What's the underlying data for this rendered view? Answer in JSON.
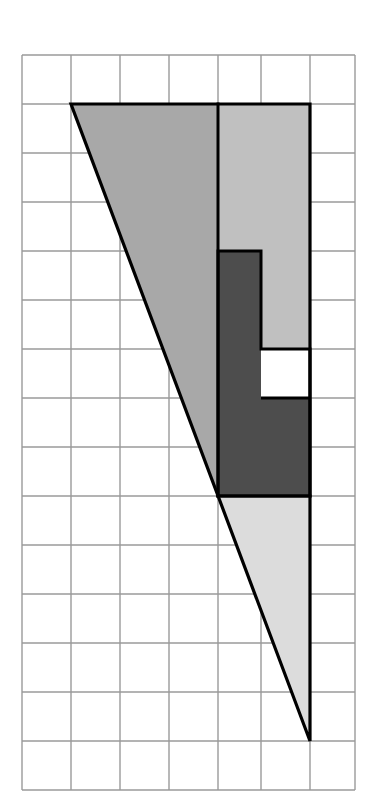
{
  "figure": {
    "canvas": {
      "width": 373,
      "height": 809,
      "background": "#ffffff"
    },
    "grid": {
      "origin_x": 22,
      "origin_y": 55,
      "cell_size": 49,
      "cols": 7,
      "rows": 15,
      "line_color": "#9a9a9a",
      "line_width": 1.4,
      "x_lines": [
        22,
        71,
        120,
        169,
        218,
        261,
        310,
        355
      ],
      "y_lines": [
        55,
        104,
        153,
        202,
        251,
        300,
        349,
        398,
        447,
        496,
        545,
        594,
        643,
        692,
        741,
        790
      ]
    },
    "palette": {
      "outline": "#000000",
      "medium_gray": "#a8a8a8",
      "light_gray": "#c0c0c0",
      "dark_gray": "#4d4d4d",
      "pale_gray": "#dcdcdc",
      "white": "#ffffff"
    },
    "outline_width": 3.2,
    "inner_outline_width": 3.0,
    "vertices": {
      "apex_top_left": [
        71,
        104
      ],
      "apex_bottom": [
        310,
        741
      ],
      "top_right": [
        310,
        104
      ]
    },
    "regions": [
      {
        "name": "medium-gray-left-region",
        "fill": "#a8a8a8",
        "points": "71,104 218,104 218,496 224,496"
      },
      {
        "name": "light-gray-upper-right-region",
        "fill": "#c0c0c0",
        "points": "218,104 310,104 310,251 261,251 261,398 310,398 310,496 218,496"
      },
      {
        "name": "dark-gray-l-region",
        "fill": "#4d4d4d",
        "points": "218,251 261,251 261,349 310,349 310,398 261,398 261,398 310,398 310,496 218,496"
      },
      {
        "name": "pale-gray-lower-region",
        "fill": "#dcdcdc",
        "points": "218,496 310,496 310,741"
      }
    ],
    "notch": {
      "name": "white-notch-cell",
      "fill": "#ffffff",
      "rect": [
        261,
        349,
        49,
        49
      ]
    }
  }
}
